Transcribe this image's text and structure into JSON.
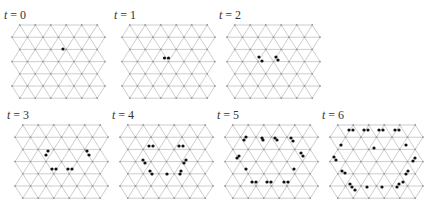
{
  "figure": {
    "lattice": {
      "rows": 7,
      "cols": 6,
      "dx": 15.5,
      "dy": 12.2
    },
    "colors": {
      "edge": "#b8b8b8",
      "vertex": "#9a9a9a",
      "particle": "#111111"
    },
    "panels": [
      {
        "label_var": "t",
        "label_eq": " = 0",
        "x": 12,
        "y": 25,
        "particles": [
          [
            63,
            49
          ]
        ]
      },
      {
        "label_var": "t",
        "label_eq": " = 1",
        "x": 122,
        "y": 25,
        "particles": [
          [
            164.5,
            58
          ],
          [
            168.5,
            58
          ]
        ]
      },
      {
        "label_var": "t",
        "label_eq": " = 2",
        "x": 227,
        "y": 25,
        "particles": [
          [
            259,
            57
          ],
          [
            262,
            61
          ],
          [
            276,
            57
          ],
          [
            278,
            60
          ]
        ]
      },
      {
        "label_var": "t",
        "label_eq": " = 3",
        "x": 15,
        "y": 125,
        "particles": [
          [
            46,
            155
          ],
          [
            48,
            151
          ],
          [
            52,
            169
          ],
          [
            56,
            169
          ],
          [
            68,
            169
          ],
          [
            72,
            169
          ],
          [
            87,
            151
          ],
          [
            89,
            155
          ]
        ]
      },
      {
        "label_var": "t",
        "label_eq": " = 4",
        "x": 120,
        "y": 125,
        "particles": [
          [
            149,
            146
          ],
          [
            153,
            146
          ],
          [
            179,
            146
          ],
          [
            183,
            146
          ],
          [
            143,
            160
          ],
          [
            145,
            163
          ],
          [
            150,
            171
          ],
          [
            152,
            174
          ],
          [
            167,
            174
          ],
          [
            181,
            171
          ],
          [
            184,
            163
          ],
          [
            186,
            160
          ],
          [
            180,
            174
          ]
        ]
      },
      {
        "label_var": "t",
        "label_eq": " = 5",
        "x": 225,
        "y": 125,
        "particles": [
          [
            244,
            140
          ],
          [
            246,
            137
          ],
          [
            263,
            140
          ],
          [
            262,
            138
          ],
          [
            275,
            138
          ],
          [
            277,
            140
          ],
          [
            291,
            138
          ],
          [
            293,
            141
          ],
          [
            237,
            158
          ],
          [
            239,
            156
          ],
          [
            301,
            153
          ],
          [
            303,
            156
          ],
          [
            246,
            169
          ],
          [
            294,
            169
          ],
          [
            252,
            182
          ],
          [
            256,
            182
          ],
          [
            267,
            182
          ],
          [
            271,
            182
          ],
          [
            284,
            182
          ],
          [
            288,
            182
          ]
        ]
      },
      {
        "label_var": "t",
        "label_eq": " = 6",
        "x": 330,
        "y": 125,
        "particles": [
          [
            349,
            130
          ],
          [
            353,
            130
          ],
          [
            364,
            130
          ],
          [
            368,
            130
          ],
          [
            379,
            130
          ],
          [
            383,
            130
          ],
          [
            395,
            130
          ],
          [
            399,
            130
          ],
          [
            341,
            145
          ],
          [
            374,
            148
          ],
          [
            406,
            145
          ],
          [
            334,
            157
          ],
          [
            336,
            160
          ],
          [
            415,
            158
          ],
          [
            413,
            161
          ],
          [
            342,
            171
          ],
          [
            345,
            173
          ],
          [
            408,
            171
          ],
          [
            406,
            174
          ],
          [
            350,
            184
          ],
          [
            352,
            187
          ],
          [
            355,
            190
          ],
          [
            367,
            187
          ],
          [
            382,
            187
          ],
          [
            397,
            187
          ],
          [
            399,
            184
          ],
          [
            403,
            182
          ]
        ]
      }
    ]
  }
}
